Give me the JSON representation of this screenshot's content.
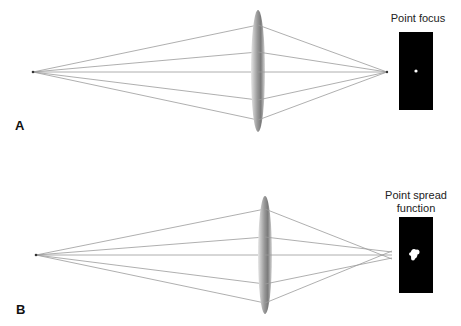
{
  "panels": [
    {
      "label": "A",
      "caption": [
        "Point focus"
      ],
      "source_point": [
        33,
        72
      ],
      "lens": {
        "cx": 258,
        "cy": 71,
        "rx": 7,
        "ry": 61
      },
      "ray_hits_y": [
        25,
        52,
        72,
        100,
        120
      ],
      "ray_ends": [
        [
          387,
          72
        ],
        [
          387,
          72
        ],
        [
          387,
          72
        ],
        [
          387,
          72
        ],
        [
          387,
          72
        ]
      ],
      "image_box": {
        "x": 399,
        "y": 32,
        "w": 34,
        "h": 78
      },
      "image_type": "point"
    },
    {
      "label": "B",
      "caption": [
        "Point spread",
        "function"
      ],
      "source_point": [
        36,
        255
      ],
      "lens": {
        "cx": 265,
        "cy": 255,
        "rx": 7,
        "ry": 59
      },
      "ray_hits_y": [
        209,
        237,
        255,
        284,
        303
      ],
      "ray_ends": [
        [
          392,
          259
        ],
        [
          392,
          252
        ],
        [
          392,
          255
        ],
        [
          392,
          258
        ],
        [
          392,
          251
        ]
      ],
      "image_box": {
        "x": 399,
        "y": 217,
        "w": 34,
        "h": 76
      },
      "image_type": "blob"
    }
  ],
  "colors": {
    "ray": "#9a9a9a",
    "lens_edge": "#b0b0b0",
    "lens_center": "#7d7d7d",
    "image_bg": "#000000",
    "spot": "#ffffff"
  }
}
